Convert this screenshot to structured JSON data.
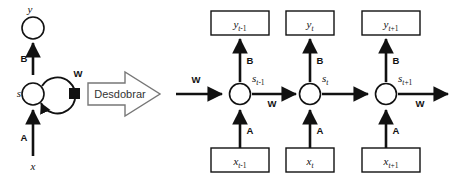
{
  "diagram": {
    "type": "recurrent-neural-network-unfolding",
    "background_color": "#ffffff",
    "ink_color": "#111111",
    "arrow_outline_color": "#777777"
  },
  "folded": {
    "output_node_label": "y",
    "state_node_label": "s",
    "input_label": "x",
    "weight_input_label": "A",
    "weight_output_label": "B",
    "weight_recurrent_label": "W",
    "recurrent_marker": "black-square"
  },
  "transform": {
    "label": "Desdobrar",
    "icon": "block-arrow-right"
  },
  "unfolded": {
    "weight_input_label": "A",
    "weight_output_label": "B",
    "weight_recurrent_label": "W",
    "incoming_weight_label": "W",
    "outgoing_weight_label": "W",
    "steps": [
      {
        "index": 0,
        "state_base": "s",
        "state_sub_italic": "t",
        "state_sub_rest": "-1",
        "output_base": "y",
        "output_sub_italic": "t",
        "output_sub_rest": "-1",
        "input_base": "x",
        "input_sub_italic": "t",
        "input_sub_rest": "-1"
      },
      {
        "index": 1,
        "state_base": "s",
        "state_sub_italic": "t",
        "state_sub_rest": "",
        "output_base": "y",
        "output_sub_italic": "t",
        "output_sub_rest": "",
        "input_base": "x",
        "input_sub_italic": "t",
        "input_sub_rest": ""
      },
      {
        "index": 2,
        "state_base": "s",
        "state_sub_italic": "t",
        "state_sub_rest": "+1",
        "output_base": "y",
        "output_sub_italic": "t",
        "output_sub_rest": "+1",
        "input_base": "x",
        "input_sub_italic": "t",
        "input_sub_rest": "+1"
      }
    ]
  }
}
